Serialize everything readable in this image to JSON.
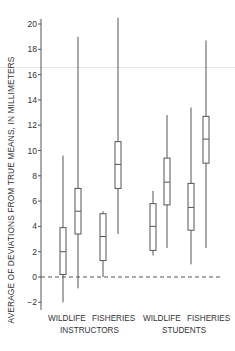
{
  "chart_data": {
    "type": "boxplot",
    "title": "",
    "ylabel": "AVERAGE OF DEVIATIONS FROM TRUE MEANS, IN MILLIMETERS",
    "xlabel": "",
    "ylim": [
      -2,
      20
    ],
    "yticks": [
      -2,
      0,
      2,
      4,
      6,
      8,
      10,
      12,
      14,
      16,
      18,
      20
    ],
    "grid": false,
    "reference_line": {
      "y": 0,
      "style": "dashed"
    },
    "groups": [
      {
        "label": "WILDLIFE",
        "parent": "INSTRUCTORS"
      },
      {
        "label": "FISHERIES",
        "parent": "INSTRUCTORS"
      },
      {
        "label": "WILDLIFE",
        "parent": "STUDENTS"
      },
      {
        "label": "FISHERIES",
        "parent": "STUDENTS"
      }
    ],
    "group_parents": [
      "INSTRUCTORS",
      "STUDENTS"
    ],
    "boxes": [
      {
        "group": 0,
        "position": "left",
        "whisker_low": -2.0,
        "q1": 0.2,
        "median": 2.0,
        "q3": 3.9,
        "whisker_high": 9.6
      },
      {
        "group": 0,
        "position": "right",
        "whisker_low": -0.9,
        "q1": 3.4,
        "median": 5.2,
        "q3": 7.0,
        "whisker_high": 19.0
      },
      {
        "group": 1,
        "position": "left",
        "whisker_low": 0.0,
        "q1": 1.3,
        "median": 3.2,
        "q3": 5.0,
        "whisker_high": 5.2
      },
      {
        "group": 1,
        "position": "right",
        "whisker_low": 3.4,
        "q1": 7.0,
        "median": 8.9,
        "q3": 10.7,
        "whisker_high": 20.5
      },
      {
        "group": 2,
        "position": "left",
        "whisker_low": 1.7,
        "q1": 2.1,
        "median": 4.0,
        "q3": 5.8,
        "whisker_high": 6.8
      },
      {
        "group": 2,
        "position": "right",
        "whisker_low": 2.3,
        "q1": 5.7,
        "median": 7.5,
        "q3": 9.4,
        "whisker_high": 12.8
      },
      {
        "group": 3,
        "position": "left",
        "whisker_low": 1.0,
        "q1": 3.7,
        "median": 5.5,
        "q3": 7.4,
        "whisker_high": 13.4
      },
      {
        "group": 3,
        "position": "right",
        "whisker_low": 2.3,
        "q1": 9.0,
        "median": 10.9,
        "q3": 12.7,
        "whisker_high": 18.7
      }
    ]
  },
  "labels": {
    "ylabel": "AVERAGE OF DEVIATIONS FROM TRUE MEANS, IN MILLIMETERS",
    "x_wildlife_instr": "WILDLIFE",
    "x_fisheries_instr": "FISHERIES",
    "x_wildlife_stud": "WILDLIFE",
    "x_fisheries_stud": "FISHERIES",
    "instructors": "INSTRUCTORS",
    "students": "STUDENTS"
  },
  "layout": {
    "box_x": [
      63,
      78,
      103,
      118,
      153,
      167,
      191,
      206
    ],
    "box_width": 6,
    "axis_x": 41,
    "y0_px": 277,
    "px_per_unit": 12.65,
    "line_color": "#555555",
    "text_color": "#333333"
  }
}
